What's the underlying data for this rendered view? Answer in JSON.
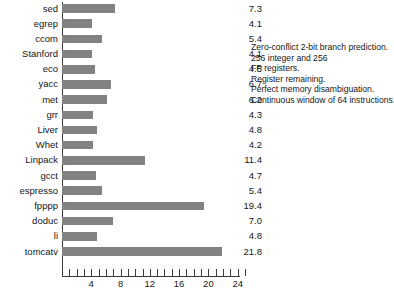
{
  "chart_data": {
    "type": "bar",
    "orientation": "horizontal",
    "title": "",
    "xlabel": "",
    "ylabel": "",
    "xlim": [
      0,
      26
    ],
    "grid": false,
    "bar_color": "#828282",
    "categories": [
      "sed",
      "egrep",
      "ccom",
      "Stanford",
      "eco",
      "yacc",
      "met",
      "grr",
      "Liver",
      "Whet",
      "Linpack",
      "gcct",
      "espresso",
      "fpppp",
      "doduc",
      "li",
      "tomcatv"
    ],
    "values": [
      7.3,
      4.1,
      5.4,
      4.1,
      4.5,
      6.7,
      6.2,
      4.3,
      4.8,
      4.2,
      11.4,
      4.7,
      5.4,
      19.4,
      7.0,
      4.8,
      21.8
    ],
    "value_labels": [
      "7.3",
      "4.1",
      "5.4",
      "4.1",
      "4.5",
      "6.7",
      "6.2",
      "4.3",
      "4.8",
      "4.2",
      "11.4",
      "4.7",
      "5.4",
      "19.4",
      "7.0",
      "4.8",
      "21.8"
    ],
    "xticks": [
      4,
      8,
      12,
      16,
      20,
      24
    ],
    "xticklabels": [
      "4",
      "8",
      "12",
      "16",
      "20",
      "24"
    ],
    "minor_tick_interval": 1,
    "annotation_lines": [
      "Zero-conflict 2-bit branch prediction.",
      "256 integer and 256",
      "FP registers.",
      "Register remaining.",
      "Perfect memory disambiguation.",
      "Continuous window of 64 instructions."
    ]
  },
  "caption": {
    "text": ""
  }
}
